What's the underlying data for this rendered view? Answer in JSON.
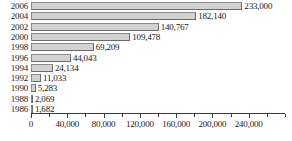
{
  "chart_data": {
    "type": "bar",
    "orientation": "horizontal",
    "title": "",
    "subtitle": "",
    "xlabel": "",
    "ylabel": "",
    "grid": false,
    "legend": false,
    "legend_position": "none",
    "xlim": [
      0,
      280000
    ],
    "xtick_interval_major": 40000,
    "xtick_interval_minor": 20000,
    "categories": [
      "2006",
      "2004",
      "2002",
      "2000",
      "1998",
      "1996",
      "1994",
      "1992",
      "1990",
      "1988",
      "1986"
    ],
    "values": [
      233000,
      182140,
      140767,
      109478,
      69209,
      44043,
      24134,
      11033,
      5283,
      2069,
      1682
    ],
    "value_labels": [
      "233,000",
      "182,140",
      "140,767",
      "109,478",
      "69,209",
      "44,043",
      "24,134",
      "11,033",
      "5,283",
      "2,069",
      "1,682"
    ],
    "xticks": [
      0,
      20000,
      40000,
      60000,
      80000,
      100000,
      120000,
      140000,
      160000,
      180000,
      200000,
      220000,
      240000,
      260000,
      280000
    ],
    "xtick_labels": [
      "0",
      "",
      "40,000",
      "",
      "80,000",
      "",
      "120,000",
      "",
      "160,000",
      "",
      "200,000",
      "",
      "240,000",
      "",
      ""
    ],
    "colors": {
      "bar_fill": "#d2d2d2",
      "bar_border": "#6b6b6b",
      "axis": "#3a3a3a",
      "text": "#1a1a1a",
      "background": "#ffffff"
    }
  }
}
